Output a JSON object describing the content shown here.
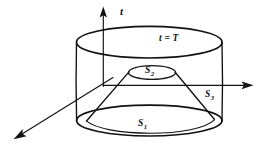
{
  "figure": {
    "background_color": "#ffffff",
    "stroke_color": "#111111",
    "labels": {
      "axis_t": "t",
      "top_surface": "t = T",
      "cone_top_surface_base": "S",
      "cone_top_surface_sub": "2",
      "cone_lateral_surface_base": "S",
      "cone_lateral_surface_sub": "3",
      "bottom_surface_base": "S",
      "bottom_surface_sub": "1"
    },
    "axes": [
      {
        "name": "t-axis",
        "direction": "up",
        "arrow": true
      },
      {
        "name": "horizontal-axis",
        "direction": "right",
        "arrow": true
      },
      {
        "name": "depth-axis",
        "direction": "lower-left",
        "arrow": true
      }
    ],
    "shapes": [
      {
        "name": "cylinder",
        "top_label": "t = T",
        "bottom_label": "S1"
      },
      {
        "name": "frustum",
        "top_label": "S2",
        "lateral_label": "S3"
      }
    ]
  }
}
